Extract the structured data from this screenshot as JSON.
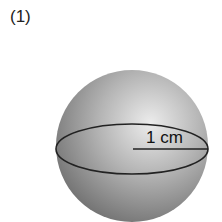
{
  "figure": {
    "label": "(1)",
    "shape": "sphere",
    "radius_label": "1 cm",
    "colors": {
      "sphere_light": "#e8e8e8",
      "sphere_mid": "#a8a8a8",
      "sphere_dark": "#6e6e6e",
      "line": "#222222"
    }
  }
}
